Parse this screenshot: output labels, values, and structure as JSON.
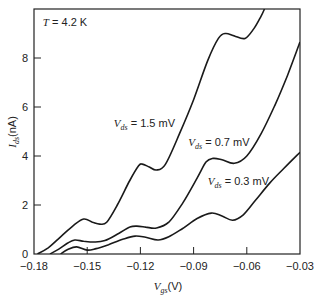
{
  "chart_data": {
    "type": "line",
    "title": "",
    "xlabel": "V_gs(V)",
    "xlabel_main": "V",
    "xlabel_sub": "gs",
    "xlabel_unit": "(V)",
    "ylabel": "I_ds(nA)",
    "ylabel_main": "I",
    "ylabel_sub": "ds",
    "ylabel_unit": "(nA)",
    "xlim": [
      -0.18,
      -0.03
    ],
    "ylim": [
      0,
      10
    ],
    "xticks": [
      -0.18,
      -0.15,
      -0.12,
      -0.09,
      -0.06,
      -0.03
    ],
    "xtick_labels": [
      "−0.18",
      "−0.15",
      "−0.12",
      "−0.09",
      "−0.06",
      "−0.03"
    ],
    "yticks": [
      0,
      2,
      4,
      6,
      8
    ],
    "ytick_labels": [
      "0",
      "2",
      "4",
      "6",
      "8"
    ],
    "grid": false,
    "legend": "inline annotations",
    "annotations": [
      {
        "text_main": "T",
        "text_rest": " = 4.2 K",
        "text": "T = 4.2 K",
        "x": -0.175,
        "y": 9.3
      },
      {
        "text_main": "V",
        "text_sub": "ds",
        "text_rest": " = 1.5 mV",
        "text": "V_ds = 1.5 mV",
        "x": -0.135,
        "y": 5.2
      },
      {
        "text_main": "V",
        "text_sub": "ds",
        "text_rest": " = 0.7 mV",
        "text": "V_ds = 0.7 mV",
        "x": -0.093,
        "y": 4.4
      },
      {
        "text_main": "V",
        "text_sub": "ds",
        "text_rest": " = 0.3 mV",
        "text": "V_ds = 0.3 mV",
        "x": -0.082,
        "y": 2.8
      }
    ],
    "series": [
      {
        "name": "V_ds = 1.5 mV",
        "x": [
          -0.178,
          -0.172,
          -0.165,
          -0.158,
          -0.152,
          -0.147,
          -0.143,
          -0.139,
          -0.133,
          -0.126,
          -0.121,
          -0.119,
          -0.115,
          -0.111,
          -0.106,
          -0.098,
          -0.09,
          -0.082,
          -0.076,
          -0.072,
          -0.067,
          -0.061,
          -0.056,
          -0.052,
          -0.05
        ],
        "values": [
          0.0,
          0.25,
          0.7,
          1.15,
          1.43,
          1.3,
          1.22,
          1.3,
          2.0,
          3.0,
          3.6,
          3.67,
          3.55,
          3.43,
          3.65,
          4.9,
          6.3,
          7.9,
          8.8,
          9.0,
          8.9,
          8.8,
          9.2,
          9.7,
          10.0
        ]
      },
      {
        "name": "V_ds = 0.7 mV",
        "x": [
          -0.171,
          -0.166,
          -0.161,
          -0.157,
          -0.152,
          -0.146,
          -0.14,
          -0.132,
          -0.126,
          -0.122,
          -0.117,
          -0.111,
          -0.104,
          -0.096,
          -0.088,
          -0.083,
          -0.079,
          -0.074,
          -0.067,
          -0.06,
          -0.052,
          -0.044,
          -0.037,
          -0.03
        ],
        "values": [
          0.0,
          0.2,
          0.45,
          0.57,
          0.52,
          0.49,
          0.55,
          0.85,
          1.1,
          1.14,
          1.1,
          1.06,
          1.3,
          2.1,
          3.1,
          3.75,
          3.9,
          3.85,
          3.7,
          4.0,
          4.9,
          6.1,
          7.3,
          8.65
        ]
      },
      {
        "name": "V_ds = 0.3 mV",
        "x": [
          -0.165,
          -0.161,
          -0.156,
          -0.15,
          -0.145,
          -0.138,
          -0.13,
          -0.123,
          -0.117,
          -0.11,
          -0.104,
          -0.096,
          -0.088,
          -0.08,
          -0.074,
          -0.068,
          -0.062,
          -0.055,
          -0.047,
          -0.039,
          -0.03
        ],
        "values": [
          0.0,
          0.18,
          0.29,
          0.16,
          0.22,
          0.38,
          0.6,
          0.73,
          0.68,
          0.57,
          0.7,
          1.05,
          1.45,
          1.67,
          1.55,
          1.38,
          1.6,
          2.2,
          2.9,
          3.5,
          4.15
        ]
      }
    ]
  }
}
